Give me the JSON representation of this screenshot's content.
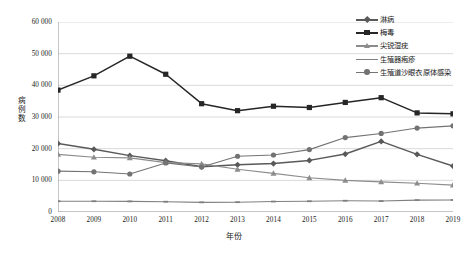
{
  "chart_data": {
    "type": "line",
    "title": "",
    "xlabel": "年份",
    "ylabel": "病例数",
    "x": [
      2008,
      2009,
      2010,
      2011,
      2012,
      2013,
      2014,
      2015,
      2016,
      2017,
      2018,
      2019
    ],
    "categories": [
      "2008",
      "2009",
      "2010",
      "2011",
      "2012",
      "2013",
      "2014",
      "2015",
      "2016",
      "2017",
      "2018",
      "2019"
    ],
    "xlim": [
      2008,
      2019
    ],
    "ylim": [
      0,
      60000
    ],
    "y_ticks": [
      0,
      10000,
      20000,
      30000,
      40000,
      50000,
      60000
    ],
    "y_tick_labels": [
      "0",
      "10 000",
      "20 000",
      "30 000",
      "40 000",
      "50 000",
      "60 000"
    ],
    "grid": "horizontal",
    "legend_position": "top-right",
    "series": [
      {
        "name": "淋病",
        "color": "#595959",
        "marker": "diamond",
        "values": [
          21600,
          19800,
          17800,
          16200,
          14300,
          14900,
          15300,
          16300,
          18300,
          22300,
          18200,
          14500
        ]
      },
      {
        "name": "梅毒",
        "color": "#262626",
        "marker": "square",
        "values": [
          38500,
          43000,
          49200,
          43500,
          34200,
          32000,
          33400,
          33000,
          34600,
          36100,
          31300,
          31000
        ]
      },
      {
        "name": "尖锐湿疣",
        "color": "#8c8c8c",
        "marker": "triangle",
        "values": [
          18200,
          17300,
          17100,
          15600,
          15200,
          13500,
          12200,
          10800,
          10000,
          9500,
          9100,
          8500
        ]
      },
      {
        "name": "生殖器疱疹",
        "color": "#808080",
        "marker": "line",
        "values": [
          3400,
          3400,
          3350,
          3250,
          3050,
          3100,
          3300,
          3400,
          3550,
          3450,
          3750,
          3800
        ]
      },
      {
        "name": "生殖道沙眼衣原体感染",
        "color": "#737373",
        "marker": "circle",
        "values": [
          12900,
          12700,
          12000,
          15500,
          14200,
          17600,
          18000,
          19700,
          23500,
          24800,
          26500,
          27200
        ]
      }
    ]
  },
  "axes": {
    "y_title": "病例数",
    "x_title": "年份"
  }
}
